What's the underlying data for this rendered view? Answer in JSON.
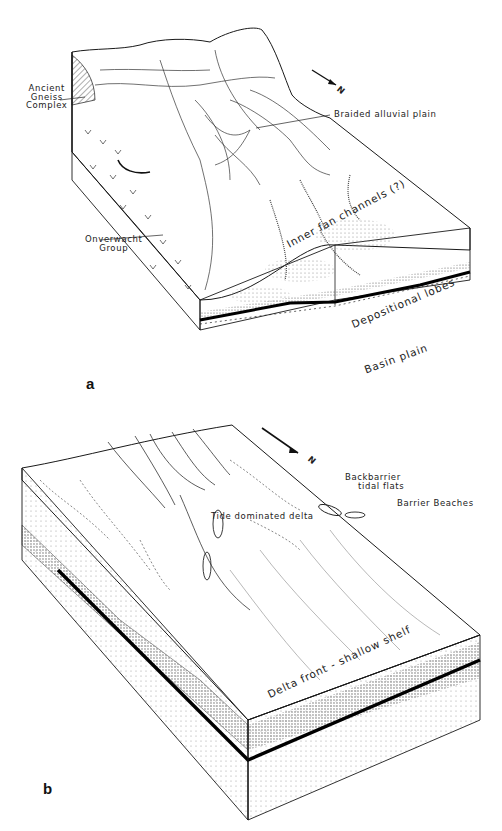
{
  "figure": {
    "panels": [
      {
        "id": "a",
        "letter": "a",
        "north_arrow": "N",
        "labels": {
          "ancient_gneiss": [
            "Ancient",
            "Gneiss",
            "Complex"
          ],
          "onverwacht": [
            "Onverwacht",
            "Group"
          ],
          "braided_plain": "Braided alluvial plain",
          "inner_fan": "Inner fan channels (?)",
          "depositional_lobes": "Depositional lobes",
          "basin_plain": "Basin plain"
        }
      },
      {
        "id": "b",
        "letter": "b",
        "north_arrow": "N",
        "labels": {
          "backbarrier": [
            "Backbarrier",
            "tidal flats"
          ],
          "barrier_beaches": "Barrier Beaches",
          "tide_delta": "Tide dominated delta",
          "delta_front": "Delta front - shallow shelf"
        }
      }
    ],
    "colors": {
      "ink": "#1a1a1a",
      "paper": "#ffffff",
      "stipple": "#9a9a9a"
    }
  }
}
